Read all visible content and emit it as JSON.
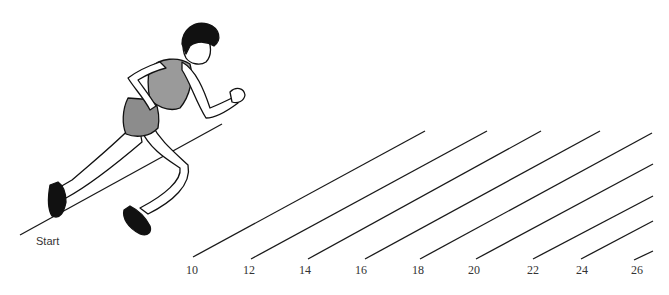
{
  "diagram": {
    "start_label": "Start",
    "distance_markers": [
      {
        "label": "10",
        "x": 186,
        "line": [
          193,
          257,
          425,
          131
        ]
      },
      {
        "label": "12",
        "x": 243,
        "line": [
          251,
          259,
          487,
          131
        ]
      },
      {
        "label": "14",
        "x": 299,
        "line": [
          308,
          259,
          541,
          131
        ]
      },
      {
        "label": "16",
        "x": 355,
        "line": [
          365,
          259,
          600,
          131
        ]
      },
      {
        "label": "18",
        "x": 412,
        "line": [
          420,
          259,
          652,
          133
        ]
      },
      {
        "label": "20",
        "x": 468,
        "line": [
          476,
          259,
          653,
          164
        ]
      },
      {
        "label": "22",
        "x": 527,
        "line": [
          533,
          259,
          653,
          196
        ]
      },
      {
        "label": "24",
        "x": 576,
        "line": [
          581,
          259,
          653,
          221
        ]
      },
      {
        "label": "26",
        "x": 631,
        "line": [
          634,
          260,
          653,
          251
        ]
      }
    ],
    "colors": {
      "line": "#1a1a1a",
      "outfit": "#8c8c8c",
      "hair": "#111111",
      "shoes": "#111111"
    }
  }
}
